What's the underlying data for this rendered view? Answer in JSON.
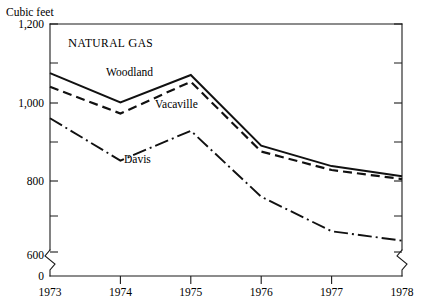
{
  "chart_data": {
    "type": "line",
    "title": "NATURAL GAS",
    "title_display_first": "N",
    "title_display_rest": "ATURAL",
    "title_display_first2": "G",
    "title_display_rest2": "AS",
    "ylabel": "Cubic feet",
    "xlabel": "",
    "x": [
      "1973",
      "1974",
      "1975",
      "1976",
      "1977",
      "1978"
    ],
    "ylim": [
      600,
      1200
    ],
    "y_axis_break": true,
    "y_axis_break_note": "0",
    "yticks": [
      "1,200",
      "1,000",
      "800",
      "600",
      "0"
    ],
    "ytick_values": [
      1200,
      1000,
      800,
      600,
      0
    ],
    "yticks_minor": [
      1100,
      900,
      700
    ],
    "grid": false,
    "legend_position": "inline-labels",
    "series": [
      {
        "name": "Woodland",
        "style": "solid",
        "values": [
          1075,
          1000,
          1070,
          890,
          838,
          812
        ]
      },
      {
        "name": "Vacaville",
        "style": "dashed",
        "values": [
          1040,
          972,
          1053,
          875,
          828,
          805
        ]
      },
      {
        "name": "Davis",
        "style": "dash-dot",
        "values": [
          960,
          852,
          928,
          760,
          672,
          648
        ]
      }
    ]
  },
  "colors": {
    "ink": "#111111",
    "axis": "#1a1a1a",
    "background": "#ffffff"
  }
}
